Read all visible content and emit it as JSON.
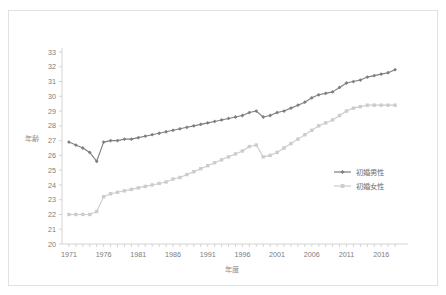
{
  "chart_data": {
    "type": "line",
    "title": "",
    "xlabel": "年度",
    "ylabel": "年齢",
    "ylim": [
      20,
      33
    ],
    "ytick_labels": [
      "20",
      "21",
      "22",
      "23",
      "24",
      "25",
      "26",
      "27",
      "28",
      "29",
      "30",
      "31",
      "32",
      "33"
    ],
    "xtick_labels": [
      "1971",
      "1976",
      "1981",
      "1986",
      "1991",
      "1996",
      "2001",
      "2006",
      "2011",
      "2016"
    ],
    "xtick_values": [
      1971,
      1976,
      1981,
      1986,
      1991,
      1996,
      2001,
      2006,
      2011,
      2016
    ],
    "xlim": [
      1970,
      2019
    ],
    "grid": false,
    "legend_position": "right",
    "x": [
      1971,
      1972,
      1973,
      1974,
      1975,
      1976,
      1977,
      1978,
      1979,
      1980,
      1981,
      1982,
      1983,
      1984,
      1985,
      1986,
      1987,
      1988,
      1989,
      1990,
      1991,
      1992,
      1993,
      1994,
      1995,
      1996,
      1997,
      1998,
      1999,
      2000,
      2001,
      2002,
      2003,
      2004,
      2005,
      2006,
      2007,
      2008,
      2009,
      2010,
      2011,
      2012,
      2013,
      2014,
      2015,
      2016,
      2017,
      2018
    ],
    "series": [
      {
        "name": "初婚男性",
        "color": "#7f7f7f",
        "marker": "diamond",
        "values": [
          26.9,
          26.7,
          26.5,
          26.2,
          25.6,
          26.9,
          27.0,
          27.0,
          27.1,
          27.1,
          27.2,
          27.3,
          27.4,
          27.5,
          27.6,
          27.7,
          27.8,
          27.9,
          28.0,
          28.1,
          28.2,
          28.3,
          28.4,
          28.5,
          28.6,
          28.7,
          28.9,
          29.0,
          28.6,
          28.7,
          28.9,
          29.0,
          29.2,
          29.4,
          29.6,
          29.9,
          30.1,
          30.2,
          30.3,
          30.6,
          30.9,
          31.0,
          31.1,
          31.3,
          31.4,
          31.5,
          31.6,
          31.8
        ]
      },
      {
        "name": "初婚女性",
        "color": "#cccccc",
        "marker": "square",
        "values": [
          22.0,
          22.0,
          22.0,
          22.0,
          22.2,
          23.2,
          23.4,
          23.5,
          23.6,
          23.7,
          23.8,
          23.9,
          24.0,
          24.1,
          24.2,
          24.4,
          24.5,
          24.7,
          24.9,
          25.1,
          25.3,
          25.5,
          25.7,
          25.9,
          26.1,
          26.3,
          26.6,
          26.7,
          25.9,
          26.0,
          26.2,
          26.5,
          26.8,
          27.1,
          27.4,
          27.7,
          28.0,
          28.2,
          28.4,
          28.7,
          29.0,
          29.2,
          29.3,
          29.4,
          29.4,
          29.4,
          29.4,
          29.4
        ]
      }
    ]
  },
  "legend": {
    "items": [
      {
        "label": "初婚男性"
      },
      {
        "label": "初婚女性"
      }
    ]
  },
  "axes": {
    "x_title": "年度",
    "y_title": "年齢"
  }
}
